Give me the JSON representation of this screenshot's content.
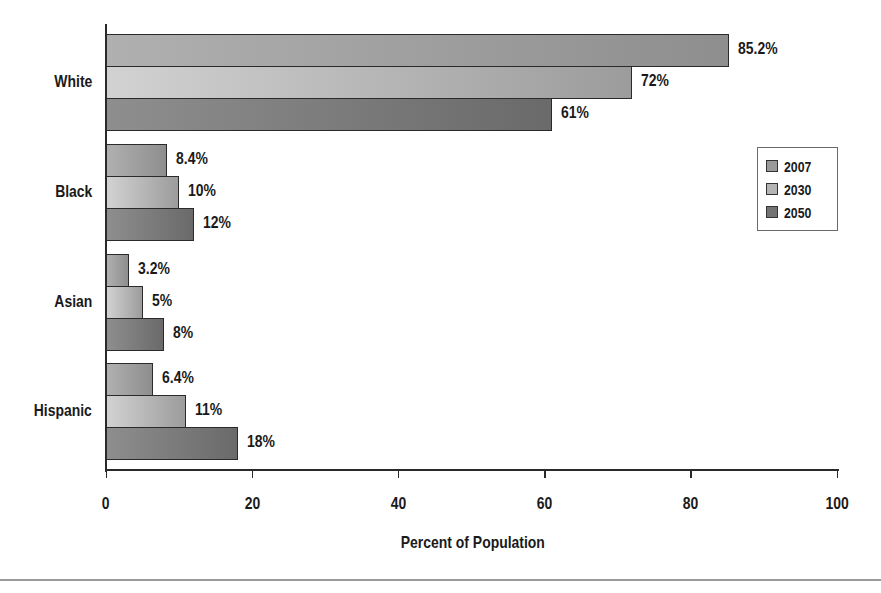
{
  "chart_data": {
    "type": "bar",
    "orientation": "horizontal",
    "title": "",
    "xlabel": "Percent of Population",
    "ylabel": "",
    "xlim": [
      0,
      100
    ],
    "x_ticks": [
      0,
      20,
      40,
      60,
      80,
      100
    ],
    "grid": false,
    "legend_position": "right",
    "categories": [
      "White",
      "Black",
      "Asian",
      "Hispanic"
    ],
    "series": [
      {
        "name": "2007",
        "values": [
          85.2,
          8.4,
          3.2,
          6.4
        ],
        "labels": [
          "85.2%",
          "8.4%",
          "3.2%",
          "6.4%"
        ],
        "color": "#9a9a9a"
      },
      {
        "name": "2030",
        "values": [
          72,
          10,
          5,
          11
        ],
        "labels": [
          "72%",
          "10%",
          "5%",
          "11%"
        ],
        "color": "#b4b4b4"
      },
      {
        "name": "2050",
        "values": [
          61,
          12,
          8,
          18
        ],
        "labels": [
          "61%",
          "12%",
          "8%",
          "18%"
        ],
        "color": "#737373"
      }
    ]
  },
  "axis": {
    "xlabel": "Percent of Population",
    "ticks": [
      "0",
      "20",
      "40",
      "60",
      "80",
      "100"
    ]
  },
  "categories": [
    "White",
    "Black",
    "Asian",
    "Hispanic"
  ],
  "legend": {
    "items": [
      {
        "label": "2007",
        "color": "#9a9a9a"
      },
      {
        "label": "2030",
        "color": "#b4b4b4"
      },
      {
        "label": "2050",
        "color": "#737373"
      }
    ]
  },
  "bars": {
    "white": {
      "v2007": "85.2%",
      "v2030": "72%",
      "v2050": "61%"
    },
    "black": {
      "v2007": "8.4%",
      "v2030": "10%",
      "v2050": "12%"
    },
    "asian": {
      "v2007": "3.2%",
      "v2030": "5%",
      "v2050": "8%"
    },
    "hispanic": {
      "v2007": "6.4%",
      "v2030": "11%",
      "v2050": "18%"
    }
  }
}
